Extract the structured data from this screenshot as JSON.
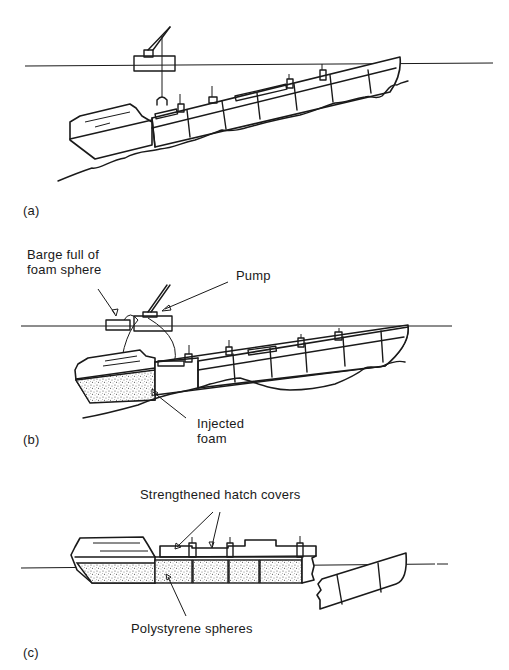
{
  "figure": {
    "panels": [
      {
        "id": "a",
        "label": "(a)",
        "description": "Sunken ship lying on seabed at an angle, salvage crane barge at surface with grab lowered"
      },
      {
        "id": "b",
        "label": "(b)",
        "description": "Foam spheres pumped from barge into flooded holds",
        "annotations": {
          "barge": "Barge full of\nfoam sphere",
          "barge_line1": "Barge full of",
          "barge_line2": "foam sphere",
          "pump": "Pump",
          "foam_line1": "Injected",
          "foam_line2": "foam"
        }
      },
      {
        "id": "c",
        "label": "(c)",
        "description": "Ship refloated with holds filled by polystyrene spheres; bow section broken away",
        "annotations": {
          "hatch": "Strengthened hatch covers",
          "spheres": "Polystyrene spheres"
        }
      }
    ],
    "colors": {
      "ink": "#1a1a1a",
      "background": "#ffffff",
      "stipple": "#555555"
    }
  }
}
